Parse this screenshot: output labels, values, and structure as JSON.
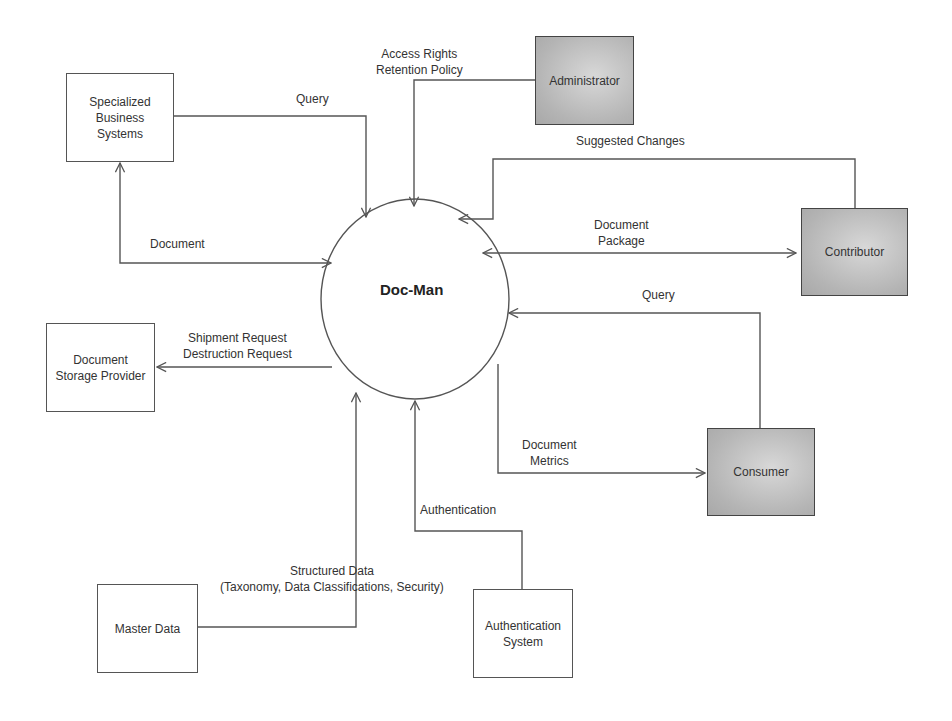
{
  "diagram": {
    "type": "context-data-flow-diagram",
    "process": {
      "label": "Doc-Man"
    },
    "entities": {
      "specialized_business_systems": {
        "label": "Specialized\nBusiness\nSystems",
        "shaded": false
      },
      "administrator": {
        "label": "Administrator",
        "shaded": true
      },
      "contributor": {
        "label": "Contributor",
        "shaded": true
      },
      "consumer": {
        "label": "Consumer",
        "shaded": true
      },
      "document_storage_provider": {
        "label": "Document\nStorage Provider",
        "shaded": false
      },
      "master_data": {
        "label": "Master Data",
        "shaded": false
      },
      "authentication_system": {
        "label": "Authentication\nSystem",
        "shaded": false
      }
    },
    "flows": {
      "sbs_query": {
        "label": "Query",
        "from": "Specialized Business Systems",
        "to": "Doc-Man"
      },
      "sbs_document": {
        "label": "Document",
        "from": "Doc-Man",
        "to": "Specialized Business Systems",
        "bidirectional": true
      },
      "admin_access": {
        "label": "Access Rights\nRetention Policy",
        "from": "Administrator",
        "to": "Doc-Man"
      },
      "contrib_suggested": {
        "label": "Suggested Changes",
        "from": "Contributor",
        "to": "Doc-Man"
      },
      "contrib_package": {
        "label": "Document\nPackage",
        "from": "Doc-Man",
        "to": "Contributor",
        "bidirectional": true
      },
      "consumer_query": {
        "label": "Query",
        "from": "Consumer",
        "to": "Doc-Man"
      },
      "consumer_metrics": {
        "label": "Document\nMetrics",
        "from": "Doc-Man",
        "to": "Consumer"
      },
      "storage_requests": {
        "label": "Shipment Request\nDestruction Request",
        "from": "Doc-Man",
        "to": "Document Storage Provider"
      },
      "master_structured": {
        "label": "Structured Data\n(Taxonomy, Data Classifications, Security)",
        "from": "Master Data",
        "to": "Doc-Man"
      },
      "auth_authentication": {
        "label": "Authentication",
        "from": "Authentication System",
        "to": "Doc-Man"
      }
    },
    "colors": {
      "line": "#555555",
      "shaded_fill": "#b8b8b8",
      "text": "#333333",
      "background": "#ffffff"
    }
  }
}
